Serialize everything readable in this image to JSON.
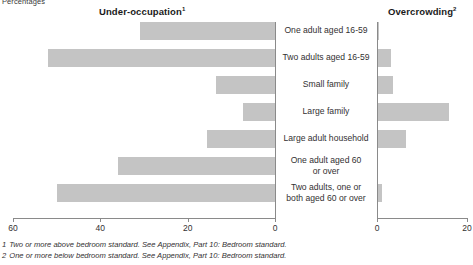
{
  "unit_label": "Percentages",
  "panels": {
    "left": {
      "title": "Under-occupation",
      "superscript": "1"
    },
    "right": {
      "title": "Overcrowding",
      "superscript": "2"
    }
  },
  "footnotes": [
    {
      "num": "1",
      "text": "Two or more above bedroom standard. See Appendix, Part 10: Bedroom standard."
    },
    {
      "num": "2",
      "text": "One or more below bedroom standard. See Appendix, Part 10: Bedroom standard."
    }
  ],
  "colors": {
    "bar_fill": "#c4c4c4",
    "axis": "#8a8a8a",
    "text": "#333132"
  },
  "chart_data": {
    "type": "bar",
    "orientation": "horizontal",
    "layout": "diverging-paired-panels",
    "xlabel": "Percentages",
    "ylabel": "",
    "grid": false,
    "legend": "none",
    "categories": [
      "One adult aged 16-59",
      "Two adults aged 16-59",
      "Small family",
      "Large family",
      "Large adult household",
      "One adult aged 60\nor over",
      "Two adults, one or\nboth aged 60 or over"
    ],
    "series": [
      {
        "name": "Under-occupation",
        "panel": "left",
        "axis_direction": "reversed",
        "xlim": [
          60,
          0
        ],
        "ticks": [
          60,
          40,
          20,
          0
        ],
        "values": [
          31,
          52,
          13.5,
          7.3,
          15.5,
          36,
          50
        ]
      },
      {
        "name": "Overcrowding",
        "panel": "right",
        "axis_direction": "normal",
        "xlim": [
          0,
          20
        ],
        "ticks": [
          0,
          20
        ],
        "values": [
          0.5,
          3,
          3.5,
          16,
          6.5,
          0,
          1
        ]
      }
    ]
  }
}
